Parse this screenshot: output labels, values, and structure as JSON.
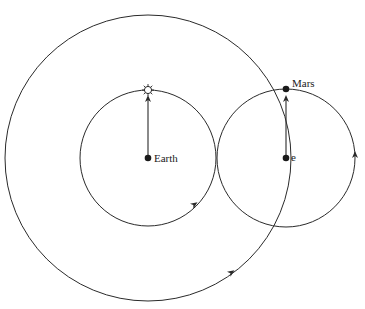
{
  "diagram": {
    "colors": {
      "stroke": "#2a2a2a",
      "background": "#ffffff"
    },
    "labels": {
      "earth": "Earth",
      "mars": "Mars",
      "epicycle_center": "e"
    },
    "elements": {
      "large_circle": {
        "cx": 148,
        "cy": 158,
        "r": 143
      },
      "sun_orbit": {
        "cx": 148,
        "cy": 158,
        "r": 68
      },
      "epicycle": {
        "cx": 286,
        "cy": 158,
        "r": 69
      },
      "sun_icon": "sun-icon",
      "earth_icon": "earth-dot-icon",
      "mars_icon": "mars-dot-icon"
    }
  }
}
